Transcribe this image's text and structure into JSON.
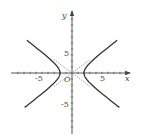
{
  "chart_data": {
    "type": "line",
    "title": "",
    "xlabel": "x",
    "ylabel": "y",
    "origin_label": "O",
    "xlim": [
      -10,
      10
    ],
    "ylim": [
      -10,
      10
    ],
    "xticks": [
      -5,
      5
    ],
    "yticks": [
      5,
      -5
    ],
    "xtick_labels": [
      "-5",
      "5"
    ],
    "ytick_labels": [
      "5",
      "-5"
    ],
    "minor_tick_step": 1,
    "grid": false,
    "series": [
      {
        "name": "hyperbola",
        "style": "solid",
        "equation": "x^2/4 - y^2/2.25 = 1",
        "a": 2,
        "b": 1.5
      },
      {
        "name": "asymptotes",
        "style": "dashed",
        "equation": "y = ±0.75x",
        "x_range": [
          -3,
          3
        ]
      }
    ],
    "colors": {
      "curve": "#333333",
      "axis": "#444444",
      "dashed": "#666666"
    }
  }
}
